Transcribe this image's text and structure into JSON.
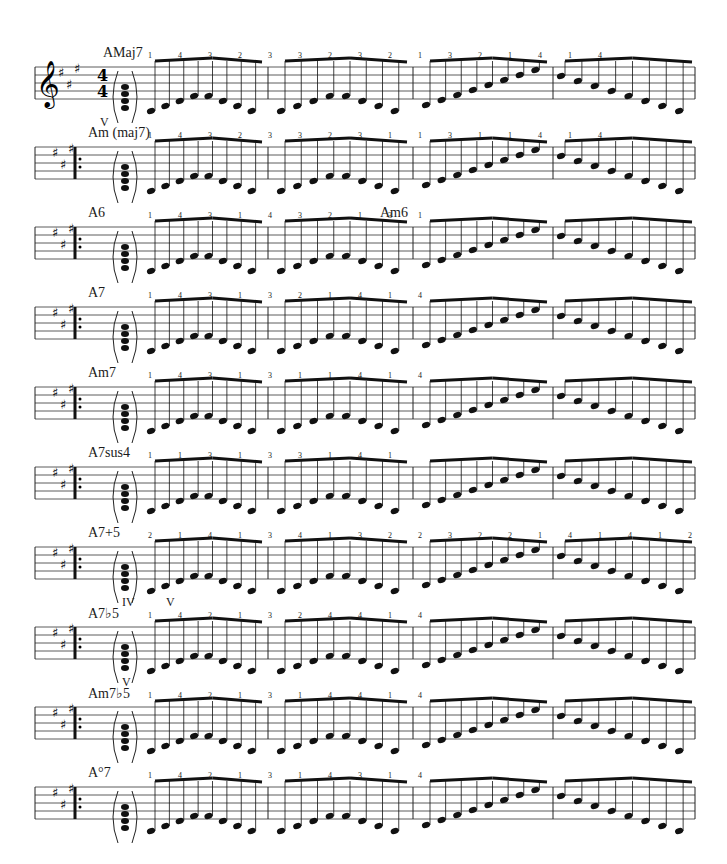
{
  "page": {
    "time_signature": "4/4",
    "key_signature": "A major (3 sharps)",
    "clef": "treble"
  },
  "systems": [
    {
      "chord": "AMaj7",
      "fingerings": [
        "1",
        "4",
        "3",
        "2",
        "3",
        "3",
        "2",
        "3",
        "2",
        "1",
        "3",
        "2",
        "1",
        "4",
        "1",
        "4"
      ],
      "roman": [
        "V"
      ]
    },
    {
      "chord": "Am (maj7)",
      "fingerings": [
        "1",
        "4",
        "3",
        "2",
        "3",
        "3",
        "2",
        "3",
        "1",
        "1",
        "3",
        "1",
        "1",
        "4",
        "1",
        "4"
      ],
      "roman": []
    },
    {
      "chord": "A6",
      "chord2": "Am6",
      "fingerings": [
        "1",
        "4",
        "3",
        "1",
        "4",
        "3",
        "2",
        "1",
        "3",
        "1"
      ],
      "fingerings2": [
        "1",
        "4",
        "3",
        "1",
        "4",
        "3",
        "1",
        "1",
        "3",
        "1"
      ],
      "roman": []
    },
    {
      "chord": "A7",
      "fingerings": [
        "1",
        "4",
        "3",
        "1",
        "3",
        "2",
        "1",
        "4",
        "1",
        "4"
      ],
      "roman": []
    },
    {
      "chord": "Am7",
      "fingerings": [
        "1",
        "4",
        "3",
        "1",
        "3",
        "1",
        "1",
        "4",
        "1",
        "4"
      ],
      "roman": []
    },
    {
      "chord": "A7sus4",
      "fingerings": [
        "1",
        "1",
        "3",
        "1",
        "3",
        "3",
        "1",
        "4",
        "1"
      ],
      "roman": []
    },
    {
      "chord": "A7+5",
      "fingerings": [
        "2",
        "1",
        "4",
        "1",
        "3",
        "4",
        "1",
        "3",
        "2",
        "2",
        "3",
        "2",
        "2",
        "1",
        "4",
        "1",
        "4",
        "1",
        "2"
      ],
      "roman": [
        "IV",
        "V"
      ]
    },
    {
      "chord": "A7♭5",
      "fingerings": [
        "1",
        "4",
        "2",
        "1",
        "3",
        "2",
        "4",
        "4",
        "1",
        "4"
      ],
      "roman": [
        "V"
      ]
    },
    {
      "chord": "Am7♭5",
      "fingerings": [
        "1",
        "4",
        "2",
        "1",
        "3",
        "1",
        "4",
        "4",
        "1",
        "4"
      ],
      "roman": []
    },
    {
      "chord": "A°7",
      "fingerings": [
        "1",
        "4",
        "2",
        "1",
        "3",
        "1",
        "4",
        "3",
        "1",
        "4"
      ],
      "roman": []
    }
  ]
}
